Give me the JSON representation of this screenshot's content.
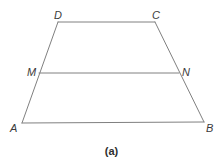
{
  "figure": {
    "caption": "(a)",
    "background_color": "#ffffff",
    "line_color": "#808080",
    "label_color": "#3b3b3b",
    "stroke_width": 1,
    "width": 223,
    "height": 166,
    "shape_type": "trapezoid-with-midsegment",
    "vertices": [
      {
        "id": "A",
        "label": "A",
        "x": 22,
        "y": 123,
        "label_x": 10,
        "label_y": 123
      },
      {
        "id": "B",
        "label": "B",
        "x": 204,
        "y": 122,
        "label_x": 206,
        "label_y": 123
      },
      {
        "id": "C",
        "label": "C",
        "x": 155,
        "y": 22,
        "label_x": 152,
        "label_y": 10
      },
      {
        "id": "D",
        "label": "D",
        "x": 58,
        "y": 22,
        "label_x": 54,
        "label_y": 10
      },
      {
        "id": "M",
        "label": "M",
        "x": 39,
        "y": 73,
        "label_x": 27,
        "label_y": 67
      },
      {
        "id": "N",
        "label": "N",
        "x": 179,
        "y": 73,
        "label_x": 182,
        "label_y": 67
      }
    ],
    "segments": [
      {
        "id": "AB",
        "name": "side-ab",
        "x1": 22,
        "y1": 123,
        "x2": 204,
        "y2": 122
      },
      {
        "id": "BC",
        "name": "side-bc",
        "x1": 204,
        "y1": 122,
        "x2": 155,
        "y2": 22
      },
      {
        "id": "CD",
        "name": "side-cd",
        "x1": 155,
        "y1": 22,
        "x2": 58,
        "y2": 22
      },
      {
        "id": "DA",
        "name": "side-da",
        "x1": 58,
        "y1": 22,
        "x2": 22,
        "y2": 123
      },
      {
        "id": "MN",
        "name": "midsegment-mn",
        "x1": 39,
        "y1": 73,
        "x2": 179,
        "y2": 73
      }
    ]
  }
}
